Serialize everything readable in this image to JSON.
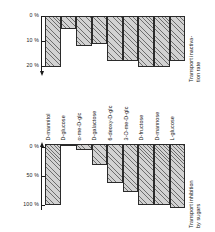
{
  "figure": {
    "categories": [
      "D-mannitol",
      "D-glucose",
      "α-me-D-glc",
      "D-galactose",
      "6-deoxy-D-glc",
      "3-O-me-D-glc",
      "D-fructose",
      "D-mannose",
      "L-glucose"
    ]
  },
  "top_panel": {
    "axis_title": "Transport inactiva-\ntion rate",
    "ticks": [
      "0 %",
      "10 %",
      "20 %"
    ]
  },
  "bottom_panel": {
    "axis_title": "Transport inhibition\nby sugars",
    "ticks": [
      "0 %",
      "50 %",
      "100 %"
    ]
  },
  "chart_data": [
    {
      "type": "bar",
      "title": "Transport inactivation rate",
      "xlabel": "",
      "ylabel": "Transport inactivation rate",
      "ylim": [
        0,
        22
      ],
      "y_inverted": true,
      "grid": false,
      "legend": "none",
      "yticks": [
        0,
        10,
        20
      ],
      "ytick_labels": [
        "0 %",
        "10 %",
        "20 %"
      ],
      "categories": [
        "D-mannitol",
        "D-glucose",
        "α-me-D-glc",
        "D-galactose",
        "6-deoxy-D-glc",
        "3-O-me-D-glc",
        "D-fructose",
        "D-mannose",
        "L-glucose"
      ],
      "values": [
        20.5,
        5.0,
        12.0,
        11.0,
        18.0,
        18.0,
        20.5,
        20.5,
        18.0
      ]
    },
    {
      "type": "bar",
      "title": "Transport inhibition by sugars",
      "xlabel": "",
      "ylabel": "Transport inhibition by sugars",
      "ylim": [
        0,
        108
      ],
      "y_inverted": true,
      "grid": false,
      "legend": "none",
      "yticks": [
        0,
        50,
        100
      ],
      "ytick_labels": [
        "0 %",
        "50 %",
        "100 %"
      ],
      "categories": [
        "D-mannitol",
        "D-glucose",
        "α-me-D-glc",
        "D-galactose",
        "6-deoxy-D-glc",
        "3-O-me-D-glc",
        "D-fructose",
        "D-mannose",
        "L-glucose"
      ],
      "values": [
        100,
        4,
        10,
        35,
        64,
        78,
        100,
        100,
        104
      ]
    }
  ]
}
